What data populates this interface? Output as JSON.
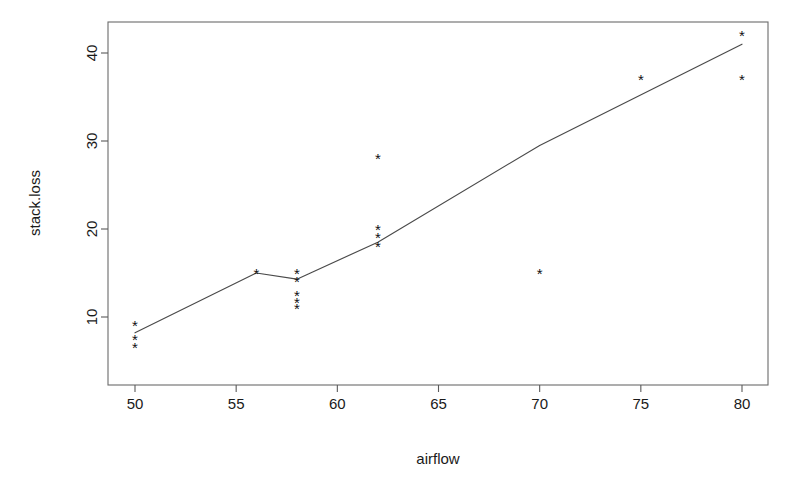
{
  "chart_data": {
    "type": "scatter",
    "title": "",
    "xlabel": "airflow",
    "ylabel": "stack.loss",
    "xlim": [
      48.6,
      81.3
    ],
    "ylim": [
      5.0,
      43.3
    ],
    "xticks": [
      50,
      55,
      60,
      65,
      70,
      75,
      80
    ],
    "xtick_labels": [
      "50",
      "55",
      "60",
      "65",
      "70",
      "75",
      "80"
    ],
    "yticks": [
      10,
      20,
      30,
      40
    ],
    "ytick_labels": [
      "10",
      "20",
      "30",
      "40"
    ],
    "grid": false,
    "legend": "none",
    "point_marker": "asterisk",
    "point_color": "#111111",
    "line_color": "#4a4a4a",
    "box_color": "#6b6b6b",
    "points": [
      {
        "x": 50,
        "y": 9.0
      },
      {
        "x": 50,
        "y": 7.5
      },
      {
        "x": 50,
        "y": 6.5
      },
      {
        "x": 56,
        "y": 15.0
      },
      {
        "x": 58,
        "y": 15.0
      },
      {
        "x": 58,
        "y": 14.0
      },
      {
        "x": 58,
        "y": 12.5
      },
      {
        "x": 58,
        "y": 11.6
      },
      {
        "x": 58,
        "y": 11.0
      },
      {
        "x": 62,
        "y": 28.0
      },
      {
        "x": 62,
        "y": 20.0
      },
      {
        "x": 62,
        "y": 19.0
      },
      {
        "x": 62,
        "y": 18.0
      },
      {
        "x": 70,
        "y": 15.0
      },
      {
        "x": 75,
        "y": 37.0
      },
      {
        "x": 80,
        "y": 42.0
      },
      {
        "x": 80,
        "y": 37.0
      }
    ],
    "series": [
      {
        "name": "fitted",
        "type": "line",
        "x": [
          50,
          56,
          58,
          62,
          70,
          80
        ],
        "values": [
          8.2,
          15.0,
          14.3,
          18.5,
          29.5,
          41.0
        ]
      }
    ]
  },
  "geometry": {
    "box": {
      "left": 108,
      "top": 22,
      "right": 768,
      "bottom": 385
    },
    "x_scale": {
      "v0": 50,
      "p0": 135,
      "v1": 80,
      "p1": 742
    },
    "y_scale": {
      "v0": 10,
      "p0": 317,
      "v1": 40,
      "p1": 53
    },
    "tick_len": 7,
    "xlabel_pos": {
      "x": 438,
      "y": 464
    },
    "ylabel_pos": {
      "x": 34,
      "y": 203
    }
  }
}
